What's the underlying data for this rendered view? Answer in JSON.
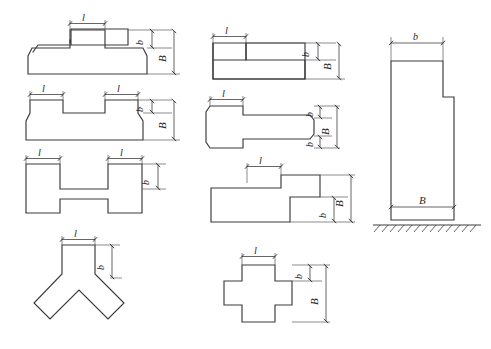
{
  "drawing": {
    "title": "Foundation and pier cross-section shape variants",
    "description": "Engineering line drawing sheet: eight plan cross-section outlines plus one vertical elevation with ground line",
    "background_color": "#ffffff",
    "line_color": "#3a3a3a",
    "dimension_color": "#4a4a4a",
    "label_style": "italic serif"
  },
  "labels": {
    "l": "l",
    "b": "b",
    "B": "B"
  },
  "figures": [
    {
      "id": "fig-t-shape",
      "name": "t-shape-section",
      "column": "left",
      "row": 1,
      "shape": "T-shape with chamfered bottom corners",
      "dimensions": [
        "l",
        "b",
        "B"
      ],
      "l_count": 1
    },
    {
      "id": "fig-u-shape",
      "name": "u-shape-section",
      "column": "left",
      "row": 2,
      "shape": "U-shape / double-stem with two raised legs",
      "dimensions": [
        "l",
        "l",
        "b",
        "B"
      ],
      "l_count": 2
    },
    {
      "id": "fig-h-shape",
      "name": "h-shape-section",
      "column": "left",
      "row": 3,
      "shape": "H-shape / I-section with two stems top and bottom",
      "dimensions": [
        "l",
        "l",
        "b"
      ],
      "l_count": 2
    },
    {
      "id": "fig-y-shape",
      "name": "y-shape-section",
      "column": "left",
      "row": 4,
      "shape": "Y-shape / branching three-arm section",
      "dimensions": [
        "l",
        "b"
      ],
      "l_count": 1
    },
    {
      "id": "fig-l-shape",
      "name": "l-shape-section",
      "column": "middle",
      "row": 1,
      "shape": "L-shape with step at upper left",
      "dimensions": [
        "l",
        "b",
        "B"
      ],
      "l_count": 1
    },
    {
      "id": "fig-tbar-shape",
      "name": "t-bar-horizontal-section",
      "column": "middle",
      "row": 2,
      "shape": "Horizontal T-bar, head at left, web extending right",
      "dimensions": [
        "l",
        "b",
        "B",
        "b"
      ],
      "l_count": 1
    },
    {
      "id": "fig-z-shape",
      "name": "z-stepped-section",
      "column": "middle",
      "row": 3,
      "shape": "Z / stepped offset section",
      "dimensions": [
        "l",
        "b",
        "B"
      ],
      "l_count": 1
    },
    {
      "id": "fig-cross-shape",
      "name": "cross-shape-section",
      "column": "middle",
      "row": 4,
      "shape": "Cross / plus shaped section",
      "dimensions": [
        "l",
        "b",
        "B"
      ],
      "l_count": 1
    },
    {
      "id": "fig-elevation",
      "name": "pier-elevation-view",
      "column": "right",
      "row": 1,
      "shape": "Vertical pier elevation with offset step, founded on hatched ground line",
      "dimensions": [
        "b",
        "B"
      ],
      "l_count": 0,
      "has_ground_line": true
    }
  ]
}
